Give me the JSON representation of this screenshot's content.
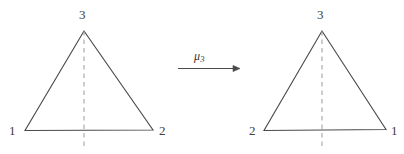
{
  "figure": {
    "type": "math-diagram",
    "background_color": "#ffffff",
    "stroke_color": "#4a4a4a",
    "dashed_color": "#9a9a9a",
    "label_color": "#404040"
  },
  "left_triangle": {
    "name": "source-triangle",
    "apex_label": "3",
    "bottom_left_label": "1",
    "bottom_right_label": "2",
    "mirror_line": "dashed vertical"
  },
  "right_triangle": {
    "name": "image-triangle",
    "apex_label": "3",
    "bottom_left_label": "2",
    "bottom_right_label": "1",
    "mirror_line": "dashed vertical"
  },
  "arrow": {
    "name": "mapping-arrow",
    "label_base": "μ",
    "label_subscript": "3",
    "direction": "right"
  }
}
